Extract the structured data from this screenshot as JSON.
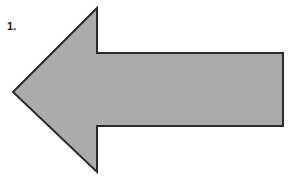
{
  "figure": {
    "label": "1.",
    "background_color": "#ffffff",
    "shape": {
      "name": "left-pointing-arrow",
      "fill_color": "#ababab",
      "outline_color": "#2b2b2b",
      "outline_width": 2,
      "direction": "left",
      "points": "13,92 97,8 97,53 283,53 283,126 97,126 97,172"
    }
  }
}
